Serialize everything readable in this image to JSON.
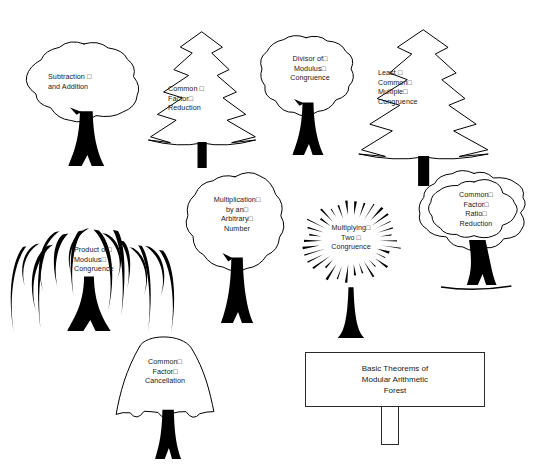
{
  "canvas": {
    "width": 537,
    "height": 464,
    "background": "#ffffff",
    "ink": "#000000",
    "text_color": "#1a1a1a"
  },
  "sign": {
    "line1": "Basic Theorems of",
    "line2": "Modular Arithmetic",
    "line3": "Forest",
    "x": 305,
    "y": 352,
    "width": 180,
    "height": 55,
    "post_width": 18,
    "post_height": 38
  },
  "trees": [
    {
      "id": "subtraction-and-addition",
      "name": "subtraction-and-addition-tree",
      "canopy": "cloud",
      "line1": "Subtraction □",
      "line2": "and Addition",
      "line3": "",
      "line4": "",
      "align": "left",
      "x": 26,
      "y": 38,
      "w": 116,
      "h": 130,
      "label_x": 22,
      "label_y": 34
    },
    {
      "id": "common-factor-reduction",
      "name": "common-factor-reduction-tree",
      "canopy": "pine",
      "line1": "Common □",
      "line2": "Factor□",
      "line3": "Reduction",
      "line4": "",
      "align": "left",
      "x": 146,
      "y": 30,
      "w": 112,
      "h": 140,
      "label_x": 22,
      "label_y": 54
    },
    {
      "id": "divisor-of-modulus-congruence",
      "name": "divisor-of-modulus-congruence-tree",
      "canopy": "cloud",
      "line1": "Divisor of□",
      "line2": "Modulus□",
      "line3": "Congruence",
      "line4": "",
      "align": "center",
      "x": 256,
      "y": 32,
      "w": 100,
      "h": 125,
      "label_x": 4,
      "label_y": 22
    },
    {
      "id": "least-common-multiple-congruence",
      "name": "least-common-multiple-congruence-tree",
      "canopy": "pine",
      "line1": "Least □",
      "line2": "Common□",
      "line3": "Multiple□",
      "line4": "Congruence",
      "align": "left",
      "x": 356,
      "y": 28,
      "w": 135,
      "h": 160,
      "label_x": 22,
      "label_y": 40
    },
    {
      "id": "product-of-modulus-congruence",
      "name": "product-of-modulus-congruence-tree",
      "canopy": "willow",
      "line1": "Product of□",
      "line2": "Modulus□",
      "line3": "Congruence",
      "line4": "",
      "align": "left",
      "x": 26,
      "y": 205,
      "w": 140,
      "h": 130,
      "label_x": 48,
      "label_y": 40
    },
    {
      "id": "multiplication-by-arbitrary-number",
      "name": "multiplication-by-arbitrary-number-tree",
      "canopy": "cloud",
      "line1": "Multiplication□",
      "line2": "by an□",
      "line3": "Arbitrary□",
      "line4": "Number",
      "align": "center",
      "x": 183,
      "y": 170,
      "w": 104,
      "h": 155,
      "label_x": 2,
      "label_y": 25
    },
    {
      "id": "multiplying-two-congruence",
      "name": "multiplying-two-congruence-tree",
      "canopy": "burst",
      "line1": "Multiplying□",
      "line2": "Two □",
      "line3": "Congruence",
      "line4": "",
      "align": "center",
      "x": 293,
      "y": 185,
      "w": 116,
      "h": 155,
      "label_x": 0,
      "label_y": 38
    },
    {
      "id": "common-factor-ratio-reduction",
      "name": "common-factor-ratio-reduction-tree",
      "canopy": "double-cloud",
      "line1": "Common□",
      "line2": "Factor□",
      "line3": "Ratio□",
      "line4": "Reduction",
      "align": "center",
      "x": 419,
      "y": 168,
      "w": 110,
      "h": 125,
      "label_x": 2,
      "label_y": 22
    },
    {
      "id": "common-factor-cancellation",
      "name": "common-factor-cancellation-tree",
      "canopy": "bell",
      "line1": "Common□",
      "line2": "Factor□",
      "line3": "Cancellation",
      "line4": "",
      "align": "center",
      "x": 113,
      "y": 333,
      "w": 104,
      "h": 128,
      "label_x": 0,
      "label_y": 24
    }
  ]
}
